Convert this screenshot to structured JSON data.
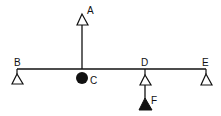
{
  "diagram": {
    "stroke_color": "#111111",
    "fill_color": "#111111",
    "background": "#ffffff",
    "beam": {
      "label": "horizontal-line"
    },
    "nodes": [
      {
        "id": "A",
        "label": "A",
        "shape": "open-triangle"
      },
      {
        "id": "B",
        "label": "B",
        "shape": "open-triangle"
      },
      {
        "id": "C",
        "label": "C",
        "shape": "filled-circle"
      },
      {
        "id": "D",
        "label": "D",
        "shape": "open-triangle"
      },
      {
        "id": "E",
        "label": "E",
        "shape": "open-triangle"
      },
      {
        "id": "F",
        "label": "F",
        "shape": "filled-triangle"
      }
    ]
  }
}
